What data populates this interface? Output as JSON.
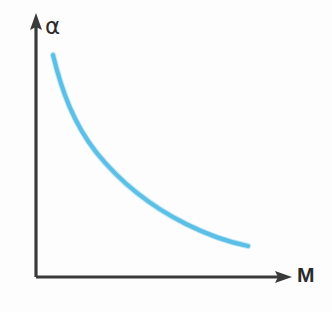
{
  "figure": {
    "background_color": "#fdfdfd"
  },
  "axes": {
    "y": {
      "label": "α",
      "icon": "up-arrow-icon",
      "color": "#3a3a3a"
    },
    "x": {
      "label": "M",
      "icon": "right-arrow-icon",
      "color": "#3a3a3a"
    }
  },
  "curve": {
    "color": "#5cc0e6",
    "halo_color": "#9bd8ef",
    "path": "M 53 55 C 62 92, 74 124, 96 152 C 120 182, 150 206, 186 224 C 208 235, 228 242, 248 246"
  },
  "chart_data": {
    "type": "line",
    "title": "",
    "xlabel": "M",
    "ylabel": "α",
    "grid": false,
    "legend": "none",
    "xlim": [
      0,
      1
    ],
    "ylim": [
      0,
      1
    ],
    "series": [
      {
        "name": "alpha(M)",
        "color": "#5cc0e6",
        "x": [
          0.07,
          0.13,
          0.2,
          0.28,
          0.36,
          0.45,
          0.55,
          0.65,
          0.75,
          0.84
        ],
        "y": [
          0.87,
          0.72,
          0.6,
          0.5,
          0.42,
          0.34,
          0.28,
          0.23,
          0.19,
          0.16
        ]
      }
    ],
    "annotations": []
  }
}
